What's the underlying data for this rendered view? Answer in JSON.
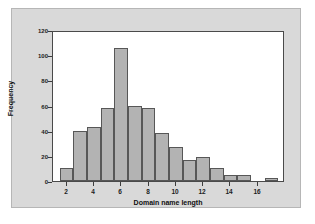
{
  "chart_data": {
    "type": "bar",
    "title": "",
    "xlabel": "Domain name length",
    "ylabel": "Frequency",
    "xlim": [
      1,
      18
    ],
    "ylim": [
      0,
      120
    ],
    "yticks": [
      0,
      20,
      40,
      60,
      80,
      100,
      120
    ],
    "xticks": [
      2,
      4,
      6,
      8,
      10,
      12,
      14,
      16
    ],
    "grid": false,
    "legend": null,
    "bin_width": 1,
    "categories": [
      2,
      3,
      4,
      5,
      6,
      7,
      8,
      9,
      10,
      11,
      12,
      13,
      14,
      15,
      16,
      17
    ],
    "values": [
      10,
      40,
      43,
      58,
      106,
      60,
      58,
      38,
      27,
      17,
      19,
      10,
      5,
      5,
      0,
      2
    ],
    "bar_color": "#b3b3b3",
    "bar_edge_color": "#575757",
    "plot_background": "#ffffff",
    "panel_background": "#d9d9d9"
  },
  "axes": {
    "y_title": "Frequency",
    "x_title": "Domain name length",
    "y_tick_labels": [
      "0",
      "20",
      "40",
      "60",
      "80",
      "100",
      "120"
    ],
    "x_tick_labels": [
      "2",
      "4",
      "6",
      "8",
      "10",
      "12",
      "14",
      "16"
    ]
  }
}
